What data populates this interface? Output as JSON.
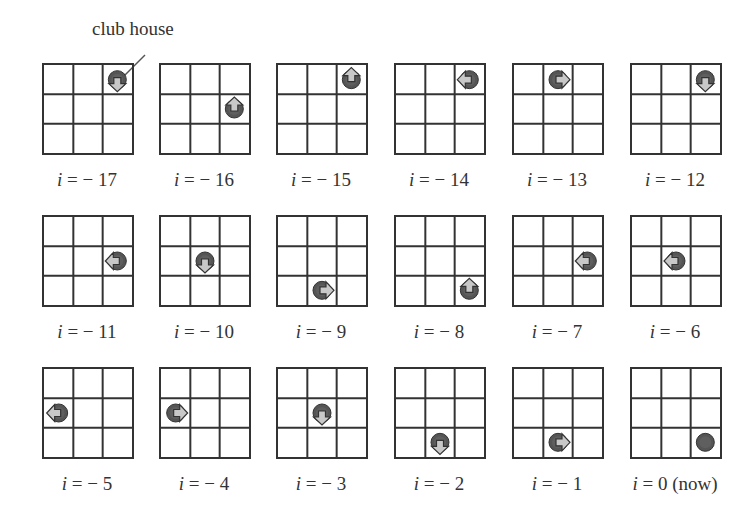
{
  "annotation": {
    "label": "club house",
    "target_panel": 0
  },
  "grid": {
    "rows": 3,
    "cols": 3,
    "line_color": "#333333",
    "token_color": "#555555",
    "arrow_color": "#c8c8c8"
  },
  "panels": [
    {
      "label_var": "i",
      "label_eq": " = − 17",
      "row": 0,
      "col": 2,
      "dir": "down"
    },
    {
      "label_var": "i",
      "label_eq": " = − 16",
      "row": 1,
      "col": 2,
      "dir": "up"
    },
    {
      "label_var": "i",
      "label_eq": " = − 15",
      "row": 0,
      "col": 2,
      "dir": "up"
    },
    {
      "label_var": "i",
      "label_eq": " = − 14",
      "row": 0,
      "col": 2,
      "dir": "left"
    },
    {
      "label_var": "i",
      "label_eq": " = − 13",
      "row": 0,
      "col": 1,
      "dir": "right"
    },
    {
      "label_var": "i",
      "label_eq": " = − 12",
      "row": 0,
      "col": 2,
      "dir": "down"
    },
    {
      "label_var": "i",
      "label_eq": " = − 11",
      "row": 1,
      "col": 2,
      "dir": "left"
    },
    {
      "label_var": "i",
      "label_eq": " = − 10",
      "row": 1,
      "col": 1,
      "dir": "down"
    },
    {
      "label_var": "i",
      "label_eq": " = − 9",
      "row": 2,
      "col": 1,
      "dir": "right"
    },
    {
      "label_var": "i",
      "label_eq": " = − 8",
      "row": 2,
      "col": 2,
      "dir": "up"
    },
    {
      "label_var": "i",
      "label_eq": " = − 7",
      "row": 1,
      "col": 2,
      "dir": "left"
    },
    {
      "label_var": "i",
      "label_eq": " = − 6",
      "row": 1,
      "col": 1,
      "dir": "left"
    },
    {
      "label_var": "i",
      "label_eq": " = − 5",
      "row": 1,
      "col": 0,
      "dir": "left"
    },
    {
      "label_var": "i",
      "label_eq": " = − 4",
      "row": 1,
      "col": 0,
      "dir": "right"
    },
    {
      "label_var": "i",
      "label_eq": " = − 3",
      "row": 1,
      "col": 1,
      "dir": "down"
    },
    {
      "label_var": "i",
      "label_eq": " = − 2",
      "row": 2,
      "col": 1,
      "dir": "down"
    },
    {
      "label_var": "i",
      "label_eq": " = − 1",
      "row": 2,
      "col": 1,
      "dir": "right"
    },
    {
      "label_var": "i",
      "label_eq": " = 0 (now)",
      "row": 2,
      "col": 2,
      "dir": "none"
    }
  ]
}
